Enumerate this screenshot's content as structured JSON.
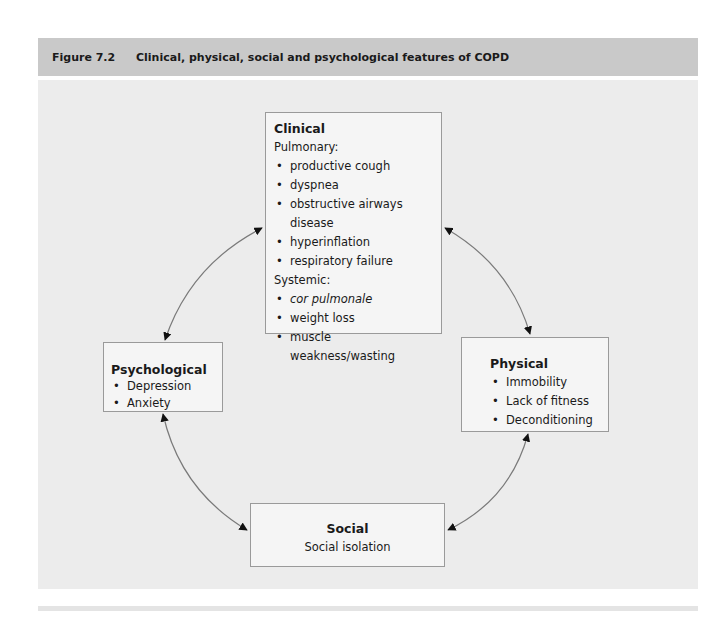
{
  "figure": {
    "number": "Figure 7.2",
    "title": "Clinical, physical, social and psychological features of COPD"
  },
  "nodes": {
    "clinical": {
      "title": "Clinical",
      "pulmonary_heading": "Pulmonary:",
      "pulmonary_items": [
        "productive cough",
        "dyspnea",
        "obstructive airways disease",
        "hyperinflation",
        "respiratory failure"
      ],
      "systemic_heading": "Systemic:",
      "systemic_items": [
        "cor pulmonale",
        "weight loss",
        "muscle weakness/wasting"
      ]
    },
    "psychological": {
      "title": "Psychological",
      "items": [
        "Depression",
        "Anxiety"
      ]
    },
    "physical": {
      "title": "Physical",
      "items": [
        "Immobility",
        "Lack of fitness",
        "Deconditioning"
      ]
    },
    "social": {
      "title": "Social",
      "items": [
        "Social isolation"
      ]
    }
  },
  "edges": [
    {
      "from": "clinical",
      "to": "psychological",
      "type": "bidirectional"
    },
    {
      "from": "clinical",
      "to": "physical",
      "type": "bidirectional"
    },
    {
      "from": "psychological",
      "to": "social",
      "type": "bidirectional"
    },
    {
      "from": "physical",
      "to": "social",
      "type": "bidirectional"
    }
  ],
  "colors": {
    "header_bg": "#c9c9c9",
    "panel_bg": "#ececec",
    "box_bg": "#f5f5f5",
    "box_border": "#9a9a9a",
    "arrow": "#7a7a7a"
  }
}
